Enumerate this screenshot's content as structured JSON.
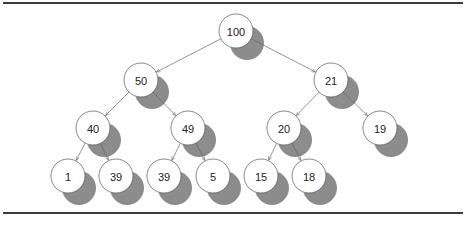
{
  "diagram": {
    "type": "binary-heap-tree",
    "style": {
      "shadow_color": "#8c8c8c",
      "node_fill": "#ffffff",
      "node_stroke": "#555555",
      "edge_color": "#666666",
      "node_radius": 17,
      "shadow_offset": [
        11,
        12
      ]
    },
    "nodes": [
      {
        "id": "n0",
        "label": "100",
        "x": 236,
        "y": 31
      },
      {
        "id": "n1",
        "label": "50",
        "x": 141,
        "y": 80
      },
      {
        "id": "n2",
        "label": "21",
        "x": 331,
        "y": 80
      },
      {
        "id": "n3",
        "label": "40",
        "x": 93,
        "y": 128
      },
      {
        "id": "n4",
        "label": "49",
        "x": 188,
        "y": 128
      },
      {
        "id": "n5",
        "label": "20",
        "x": 284,
        "y": 128
      },
      {
        "id": "n6",
        "label": "19",
        "x": 380,
        "y": 128
      },
      {
        "id": "n7",
        "label": "1",
        "x": 68,
        "y": 176
      },
      {
        "id": "n8",
        "label": "39",
        "x": 116,
        "y": 176
      },
      {
        "id": "n9",
        "label": "39",
        "x": 164,
        "y": 176
      },
      {
        "id": "n10",
        "label": "5",
        "x": 213,
        "y": 176
      },
      {
        "id": "n11",
        "label": "15",
        "x": 261,
        "y": 176
      },
      {
        "id": "n12",
        "label": "18",
        "x": 309,
        "y": 176
      }
    ],
    "edges": [
      {
        "from": "n0",
        "to": "n1"
      },
      {
        "from": "n0",
        "to": "n2"
      },
      {
        "from": "n1",
        "to": "n3"
      },
      {
        "from": "n1",
        "to": "n4"
      },
      {
        "from": "n2",
        "to": "n5"
      },
      {
        "from": "n2",
        "to": "n6"
      },
      {
        "from": "n3",
        "to": "n7"
      },
      {
        "from": "n3",
        "to": "n8"
      },
      {
        "from": "n4",
        "to": "n9"
      },
      {
        "from": "n4",
        "to": "n10"
      },
      {
        "from": "n5",
        "to": "n11"
      },
      {
        "from": "n5",
        "to": "n12"
      }
    ]
  }
}
